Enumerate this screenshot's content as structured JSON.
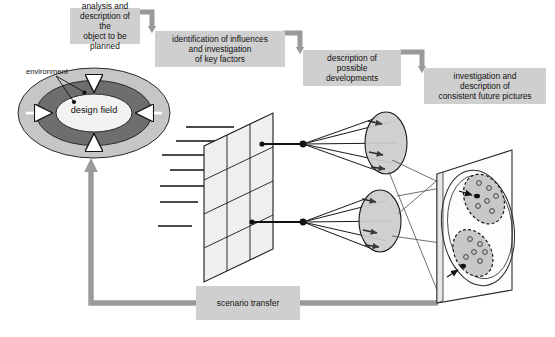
{
  "diagram": {
    "palette": {
      "box_fill": "#cfcfcf",
      "connector_gray": "#9a9a9a",
      "ring_outer": "#c6c6c6",
      "ring_mid": "#6e6e6e",
      "core_fill": "#f2f2f2",
      "plane_fill": "#efefef",
      "ellipse_fill": "#cccccc",
      "cluster_fill": "#c8c8c8",
      "stroke_dark": "#1a1a1a",
      "stroke_mid": "#555555"
    },
    "boxes": [
      {
        "id": "analysis-box",
        "lines": [
          "analysis and",
          "description of  the",
          "object to be planned"
        ]
      },
      {
        "id": "identification-box",
        "lines": [
          "identification of influences",
          "and investigation",
          "of key factors"
        ]
      },
      {
        "id": "developments-box",
        "lines": [
          "description of",
          "possible",
          "developments"
        ]
      },
      {
        "id": "future-pictures-box",
        "lines": [
          "investigation and",
          "description of",
          "consistent future pictures"
        ]
      }
    ],
    "design_field": {
      "label_lines": [
        "design",
        "field"
      ],
      "environment_label": "environment"
    },
    "feedback": {
      "label": "scenario transfer"
    },
    "matrix": {
      "input_line_count": 7,
      "grid_cols": 3,
      "grid_rows": 4
    },
    "projections": {
      "cone_count": 2,
      "ellipse_marker_count": 3
    },
    "future_panel": {
      "cluster_count": 2,
      "points_per_cluster": 6
    }
  }
}
